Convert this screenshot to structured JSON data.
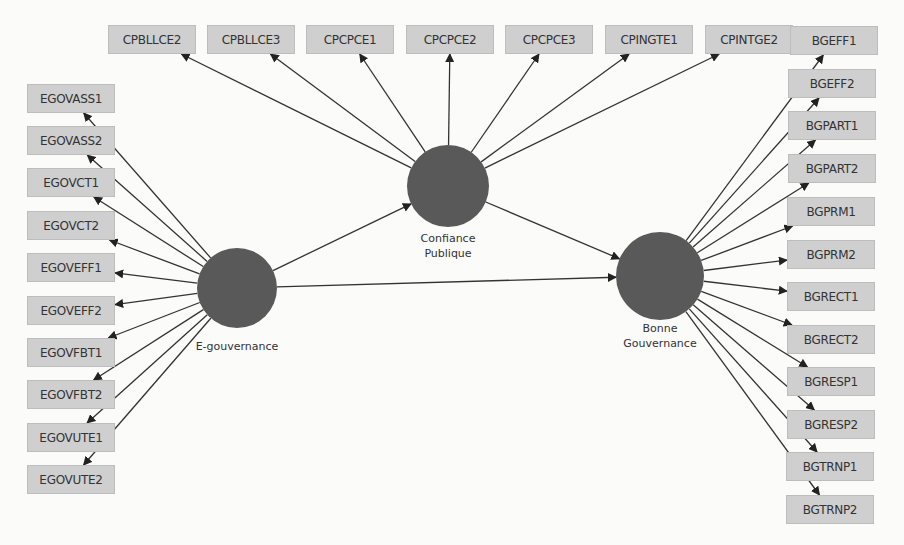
{
  "diagram": {
    "type": "PLS-SEM path model",
    "latent_variables": [
      {
        "id": "egov",
        "label": "E-gouvernance",
        "cx": 237,
        "cy": 288,
        "r": 40,
        "label_x": 237,
        "label_y": 345
      },
      {
        "id": "cp",
        "label": "Confiance\nPublique",
        "cx": 448,
        "cy": 186,
        "r": 41,
        "label_x": 448,
        "label_y": 237
      },
      {
        "id": "bg",
        "label": "Bonne\nGouvernance",
        "cx": 660,
        "cy": 276,
        "r": 44,
        "label_x": 660,
        "label_y": 327
      }
    ],
    "structural_paths": [
      {
        "from": "egov",
        "to": "cp"
      },
      {
        "from": "cp",
        "to": "bg"
      },
      {
        "from": "egov",
        "to": "bg"
      }
    ],
    "indicators": {
      "egov": [
        {
          "label": "EGOVASS1",
          "x": 27,
          "y": 84
        },
        {
          "label": "EGOVASS2",
          "x": 27,
          "y": 126
        },
        {
          "label": "EGOVCT1",
          "x": 27,
          "y": 168
        },
        {
          "label": "EGOVCT2",
          "x": 27,
          "y": 211
        },
        {
          "label": "EGOVEFF1",
          "x": 27,
          "y": 253
        },
        {
          "label": "EGOVEFF2",
          "x": 27,
          "y": 296
        },
        {
          "label": "EGOVFBT1",
          "x": 27,
          "y": 338
        },
        {
          "label": "EGOVFBT2",
          "x": 27,
          "y": 380
        },
        {
          "label": "EGOVUTE1",
          "x": 27,
          "y": 423
        },
        {
          "label": "EGOVUTE2",
          "x": 27,
          "y": 465
        }
      ],
      "cp": [
        {
          "label": "CPBLLCE2",
          "x": 108,
          "y": 25
        },
        {
          "label": "CPBLLCE3",
          "x": 207,
          "y": 25
        },
        {
          "label": "CPCPCE1",
          "x": 306,
          "y": 25
        },
        {
          "label": "CPCPCE2",
          "x": 406,
          "y": 25
        },
        {
          "label": "CPCPCE3",
          "x": 505,
          "y": 25
        },
        {
          "label": "CPINGTE1",
          "x": 605,
          "y": 25
        },
        {
          "label": "CPINTGE2",
          "x": 705,
          "y": 25
        }
      ],
      "bg": [
        {
          "label": "BGEFF1",
          "x": 790,
          "y": 26
        },
        {
          "label": "BGEFF2",
          "x": 788,
          "y": 69
        },
        {
          "label": "BGPART1",
          "x": 788,
          "y": 111
        },
        {
          "label": "BGPART2",
          "x": 788,
          "y": 154
        },
        {
          "label": "BGPRM1",
          "x": 787,
          "y": 197
        },
        {
          "label": "BGPRM2",
          "x": 787,
          "y": 240
        },
        {
          "label": "BGRECT1",
          "x": 787,
          "y": 282
        },
        {
          "label": "BGRECT2",
          "x": 787,
          "y": 325
        },
        {
          "label": "BGRESP1",
          "x": 787,
          "y": 367
        },
        {
          "label": "BGRESP2",
          "x": 787,
          "y": 410
        },
        {
          "label": "BGTRNP1",
          "x": 786,
          "y": 452
        },
        {
          "label": "BGTRNP2",
          "x": 786,
          "y": 495
        }
      ]
    },
    "box_width": 88,
    "box_height": 29,
    "colors": {
      "node_fill": "#595959",
      "box_fill": "#cfcfcf",
      "box_border": "#bdbdbd",
      "edge": "#333333",
      "background": "#fbfbfa"
    }
  }
}
